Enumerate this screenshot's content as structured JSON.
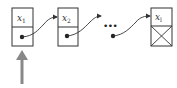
{
  "diagram": {
    "type": "linked-list",
    "nodes": [
      {
        "label": "x",
        "subscript": "1",
        "terminal": false
      },
      {
        "label": "x",
        "subscript": "2",
        "terminal": false
      },
      {
        "label": "x",
        "subscript": "l",
        "terminal": true
      }
    ],
    "ellipsis": "•••",
    "head_pointer": "up-arrow",
    "colors": {
      "stroke": "#333333",
      "arrow": "#888888",
      "bg": "#ffffff"
    }
  }
}
